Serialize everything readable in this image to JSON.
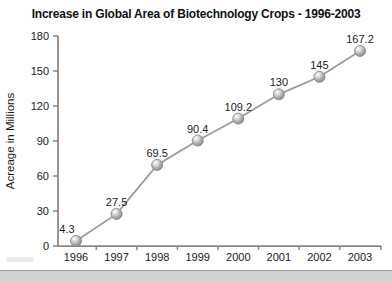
{
  "title": "Increase in Global Area of Biotechnology Crops - 1996-2003",
  "chart_data": {
    "type": "line",
    "title": "Increase in Global Area of Biotechnology Crops - 1996-2003",
    "xlabel": "",
    "ylabel": "Acreage in Millions",
    "categories": [
      "1996",
      "1997",
      "1998",
      "1999",
      "2000",
      "2001",
      "2002",
      "2003"
    ],
    "values": [
      4.3,
      27.5,
      69.5,
      90.4,
      109.2,
      130,
      145,
      167.2
    ],
    "point_labels": [
      "4.3",
      "27.5",
      "69.5",
      "90.4",
      "109.2",
      "130",
      "145",
      "167.2"
    ],
    "ylim": [
      0,
      180
    ],
    "yticks": [
      0,
      30,
      60,
      90,
      120,
      150,
      180
    ],
    "grid": false,
    "legend": false,
    "colors": {
      "line": "#9a9a9a",
      "marker_highlight": "#ffffff",
      "marker_mid": "#b4b4b4",
      "marker_edge": "#8c8c8c",
      "marker_outline": "#7d7d7d",
      "axis": "#878787",
      "text": "#1a1a1a"
    }
  },
  "footer": {
    "band_color": "#d2d2d2",
    "band_line_color": "#999999"
  }
}
